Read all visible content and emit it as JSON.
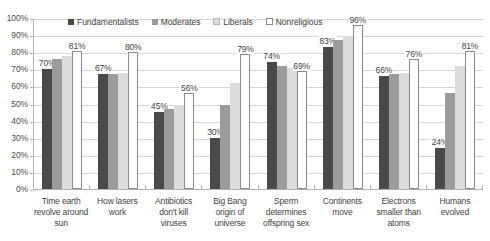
{
  "chart_data": {
    "type": "bar",
    "title": "",
    "subtitle": "",
    "xlabel": "",
    "ylabel": "",
    "ylim": [
      0,
      100
    ],
    "ytick_labels": [
      "100%",
      "90%",
      "80%",
      "70%",
      "60%",
      "50%",
      "40%",
      "30%",
      "20%",
      "10%",
      "0%"
    ],
    "ytick_values": [
      100,
      90,
      80,
      70,
      60,
      50,
      40,
      30,
      20,
      10,
      0
    ],
    "grid": true,
    "legend_position": "top",
    "orientation": "vertical",
    "categories": [
      "Time earth revolve around sun",
      "How lasers work",
      "Antibiotics don't kill viruses",
      "Big Bang origin of universe",
      "Sperm determines offspring sex",
      "Continents move",
      "Electrons smaller than atoms",
      "Humans evolved"
    ],
    "category_lines": [
      [
        "Time earth",
        "revolve around",
        "sun"
      ],
      [
        "How lasers",
        "work"
      ],
      [
        "Antibiotics",
        "don't kill",
        "viruses"
      ],
      [
        "Big Bang",
        "origin of",
        "universe"
      ],
      [
        "Sperm",
        "determines",
        "offspring sex"
      ],
      [
        "Continents",
        "move"
      ],
      [
        "Electrons",
        "smaller than",
        "atoms"
      ],
      [
        "Humans",
        "evolved"
      ]
    ],
    "series": [
      {
        "name": "Fundamentalists",
        "color": "#494949",
        "values": [
          70,
          67,
          45,
          30,
          74,
          83,
          66,
          24
        ],
        "labels": [
          "70%",
          "67%",
          "45%",
          "30%",
          "74%",
          "83%",
          "66%",
          "24%"
        ],
        "labels_shown": true
      },
      {
        "name": "Moderates",
        "color": "#9b9b9b",
        "values": [
          76,
          67,
          47,
          49,
          72,
          87,
          67,
          56
        ],
        "labels": [
          "",
          "",
          "",
          "",
          "",
          "",
          "",
          ""
        ],
        "labels_shown": false
      },
      {
        "name": "Liberals",
        "color": "#dcdcdc",
        "values": [
          78,
          68,
          49,
          62,
          71,
          89,
          68,
          72
        ],
        "labels": [
          "",
          "",
          "",
          "",
          "",
          "",
          "",
          ""
        ],
        "labels_shown": false
      },
      {
        "name": "Nonreligious",
        "color": "#ffffff",
        "values": [
          81,
          80,
          56,
          79,
          69,
          96,
          76,
          81
        ],
        "labels": [
          "81%",
          "80%",
          "56%",
          "79%",
          "69%",
          "96%",
          "76%",
          "81%"
        ],
        "labels_shown": true
      }
    ]
  },
  "legend": {
    "items": [
      {
        "label": "Fundamentalists",
        "swatch": "legend-swatch-fundamentalists"
      },
      {
        "label": "Moderates",
        "swatch": "legend-swatch-moderates"
      },
      {
        "label": "Liberals",
        "swatch": "legend-swatch-liberals"
      },
      {
        "label": "Nonreligious",
        "swatch": "legend-swatch-nonreligious"
      }
    ]
  },
  "colors": {
    "fundamentalists": "#494949",
    "moderates": "#9b9b9b",
    "liberals": "#dcdcdc",
    "nonreligious": "#ffffff",
    "axis": "#b2b2b2",
    "gridline": "#d7d7d7",
    "text": "#3f3f3f",
    "background": "#ffffff"
  }
}
